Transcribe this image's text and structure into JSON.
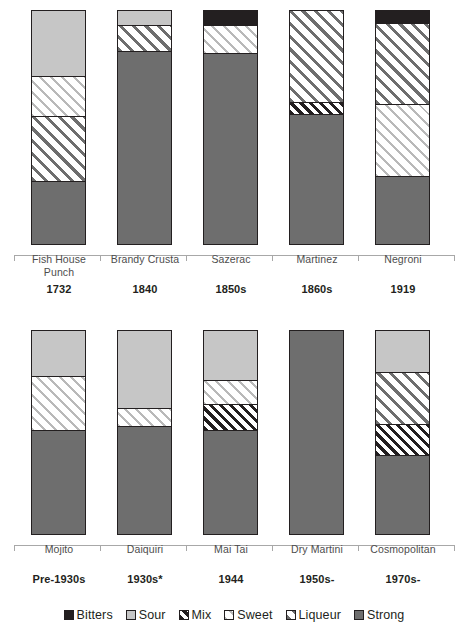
{
  "chart_data": {
    "type": "bar",
    "subtype": "stacked-bar-100pct",
    "title": "",
    "subtitle": "",
    "xlabel": "",
    "ylabel": "",
    "ylim": [
      0,
      100
    ],
    "grid": false,
    "legend_position": "bottom",
    "orientation": "vertical",
    "stack_order_bottom_to_top": [
      "Strong",
      "Mix",
      "Liqueur",
      "Sweet",
      "Sour",
      "Bitters"
    ],
    "series": [
      {
        "name": "Bitters",
        "key": "bitters",
        "color": "#231f20",
        "pattern": "solid",
        "values": [
          0,
          0,
          6,
          0,
          5,
          0,
          0,
          0,
          0,
          0
        ]
      },
      {
        "name": "Sour",
        "key": "sour",
        "color": "#c6c6c6",
        "pattern": "solid",
        "values": [
          28,
          6,
          0,
          0,
          0,
          22,
          38,
          24,
          0,
          20
        ]
      },
      {
        "name": "Mix",
        "key": "mix",
        "color": "#231f20",
        "pattern": "diagonal-dense",
        "values": [
          0,
          0,
          0,
          5,
          0,
          0,
          0,
          13,
          0,
          15
        ]
      },
      {
        "name": "Sweet",
        "key": "sweet",
        "color": "#b9b9b9",
        "pattern": "diagonal-light",
        "values": [
          17,
          0,
          12,
          0,
          31,
          27,
          9,
          12,
          0,
          0
        ]
      },
      {
        "name": "Liqueur",
        "key": "liqueur",
        "color": "#6e6e6e",
        "pattern": "diagonal-medium",
        "values": [
          28,
          11,
          0,
          39,
          35,
          0,
          0,
          0,
          0,
          26
        ]
      },
      {
        "name": "Strong",
        "key": "strong",
        "color": "#6e6e6e",
        "pattern": "solid",
        "values": [
          27,
          83,
          82,
          56,
          29,
          51,
          53,
          51,
          100,
          39
        ]
      }
    ],
    "categories": [
      "Fish House Punch",
      "Brandy Crusta",
      "Sazerac",
      "Martinez",
      "Negroni",
      "Mojito",
      "Daiquiri",
      "Mai Tai",
      "Dry Martini",
      "Cosmopolitan"
    ],
    "category_years": [
      "1732",
      "1840",
      "1850s",
      "1860s",
      "1919",
      "Pre-1930s",
      "1930s*",
      "1944",
      "1950s-",
      "1970s-"
    ]
  },
  "rows": [
    {
      "bars": [
        {
          "name": "Fish House Punch",
          "year": "1732",
          "segments": [
            {
              "cat": "Sour",
              "pct": 28
            },
            {
              "cat": "Sweet",
              "pct": 17
            },
            {
              "cat": "Liqueur",
              "pct": 28
            },
            {
              "cat": "Strong",
              "pct": 27
            }
          ]
        },
        {
          "name": "Brandy Crusta",
          "year": "1840",
          "segments": [
            {
              "cat": "Sour",
              "pct": 6
            },
            {
              "cat": "Liqueur",
              "pct": 11
            },
            {
              "cat": "Strong",
              "pct": 83
            }
          ]
        },
        {
          "name": "Sazerac",
          "year": "1850s",
          "segments": [
            {
              "cat": "Bitters",
              "pct": 6
            },
            {
              "cat": "Sweet",
              "pct": 12
            },
            {
              "cat": "Strong",
              "pct": 82
            }
          ]
        },
        {
          "name": "Martinez",
          "year": "1860s",
          "segments": [
            {
              "cat": "Liqueur",
              "pct": 39
            },
            {
              "cat": "Mix",
              "pct": 5
            },
            {
              "cat": "Strong",
              "pct": 56
            }
          ]
        },
        {
          "name": "Negroni",
          "year": "1919",
          "segments": [
            {
              "cat": "Bitters",
              "pct": 5
            },
            {
              "cat": "Liqueur",
              "pct": 35
            },
            {
              "cat": "Sweet",
              "pct": 31
            },
            {
              "cat": "Strong",
              "pct": 29
            }
          ]
        }
      ]
    },
    {
      "bars": [
        {
          "name": "Mojito",
          "year": "Pre-1930s",
          "segments": [
            {
              "cat": "Sour",
              "pct": 22
            },
            {
              "cat": "Sweet",
              "pct": 27
            },
            {
              "cat": "Strong",
              "pct": 51
            }
          ]
        },
        {
          "name": "Daiquiri",
          "year": "1930s*",
          "segments": [
            {
              "cat": "Sour",
              "pct": 38
            },
            {
              "cat": "Sweet",
              "pct": 9
            },
            {
              "cat": "Strong",
              "pct": 53
            }
          ]
        },
        {
          "name": "Mai Tai",
          "year": "1944",
          "segments": [
            {
              "cat": "Sour",
              "pct": 24
            },
            {
              "cat": "Sweet",
              "pct": 12
            },
            {
              "cat": "Mix",
              "pct": 13
            },
            {
              "cat": "Strong",
              "pct": 51
            }
          ]
        },
        {
          "name": "Dry Martini",
          "year": "1950s-",
          "segments": [
            {
              "cat": "Strong",
              "pct": 100
            }
          ]
        },
        {
          "name": "Cosmopolitan",
          "year": "1970s-",
          "segments": [
            {
              "cat": "Sour",
              "pct": 20
            },
            {
              "cat": "Liqueur",
              "pct": 26
            },
            {
              "cat": "Mix",
              "pct": 15
            },
            {
              "cat": "Strong",
              "pct": 39
            }
          ]
        }
      ]
    }
  ],
  "legend": {
    "items": [
      {
        "label": "Bitters",
        "key": "bitters"
      },
      {
        "label": "Sour",
        "key": "sour"
      },
      {
        "label": "Mix",
        "key": "mix"
      },
      {
        "label": "Sweet",
        "key": "sweet"
      },
      {
        "label": "Liqueur",
        "key": "liqueur"
      },
      {
        "label": "Strong",
        "key": "strong"
      }
    ]
  }
}
